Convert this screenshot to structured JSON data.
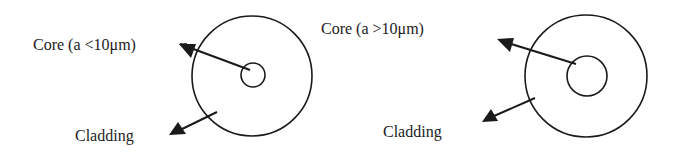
{
  "diagram": {
    "left": {
      "core_label": "Core (a <10μm)",
      "cladding_label": "Cladding"
    },
    "right": {
      "core_label": "Core (a >10μm)",
      "cladding_label": "Cladding"
    },
    "colors": {
      "stroke": "#1a1a1a",
      "text": "#222222",
      "background": "#ffffff"
    }
  }
}
